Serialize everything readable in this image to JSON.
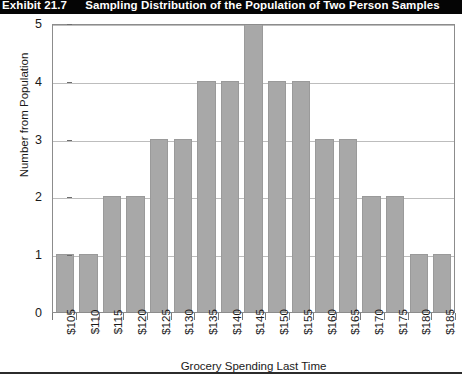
{
  "exhibit": {
    "label": "Exhibit 21.7",
    "title": "Sampling Distribution of the Population of Two Person Samples"
  },
  "chart_data": {
    "type": "bar",
    "title": "Sampling Distribution of the Population of Two Person Samples",
    "xlabel": "Grocery Spending Last Time",
    "ylabel": "Number from Population",
    "categories": [
      "$105",
      "$110",
      "$115",
      "$120",
      "$125",
      "$130",
      "$135",
      "$140",
      "$145",
      "$150",
      "$155",
      "$160",
      "$165",
      "$170",
      "$175",
      "$180",
      "$185"
    ],
    "values": [
      1,
      1,
      2,
      2,
      3,
      3,
      4,
      4,
      5,
      4,
      4,
      3,
      3,
      2,
      2,
      1,
      1
    ],
    "ylim": [
      0,
      5
    ],
    "yticks": [
      0,
      1,
      2,
      3,
      4,
      5
    ],
    "ytick_labels": [
      "0",
      "1",
      "2",
      "3",
      "4",
      "5"
    ],
    "grid": true,
    "legend": false,
    "bar_color": "#a8a8a8",
    "grid_color": "#bdbdbd",
    "axis_color": "#8c8c8c",
    "banner_color": "#050505"
  }
}
